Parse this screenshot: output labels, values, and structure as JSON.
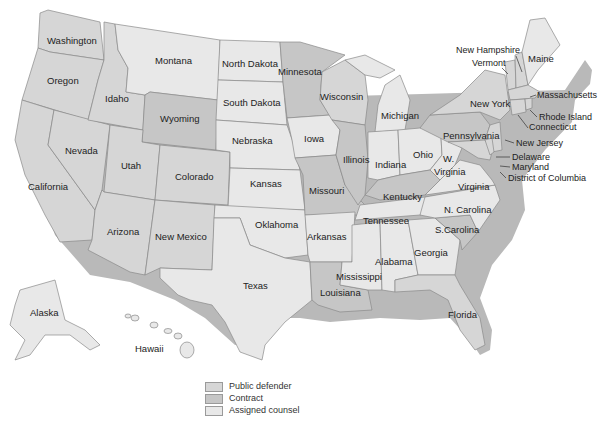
{
  "caption_fragment": "",
  "legend": {
    "items": [
      {
        "label": "Public defender",
        "color": "#d6d6d6"
      },
      {
        "label": "Contract",
        "color": "#c6c6c6"
      },
      {
        "label": "Assigned counsel",
        "color": "#e8e8e8"
      }
    ]
  },
  "labels": {
    "washington": "Washington",
    "oregon": "Oregon",
    "idaho": "Idaho",
    "montana": "Montana",
    "wyoming": "Wyoming",
    "nevada": "Nevada",
    "california": "California",
    "utah": "Utah",
    "colorado": "Colorado",
    "arizona": "Arizona",
    "new_mexico": "New Mexico",
    "north_dakota": "North Dakota",
    "south_dakota": "South Dakota",
    "nebraska": "Nebraska",
    "kansas": "Kansas",
    "oklahoma": "Oklahoma",
    "texas": "Texas",
    "minnesota": "Minnesota",
    "iowa": "Iowa",
    "missouri": "Missouri",
    "arkansas": "Arkansas",
    "louisiana": "Louisiana",
    "wisconsin": "Wisconsin",
    "illinois": "Illinois",
    "michigan": "Michigan",
    "indiana": "Indiana",
    "ohio": "Ohio",
    "kentucky": "Kentucky",
    "tennessee": "Tennessee",
    "mississippi": "Mississippi",
    "alabama": "Alabama",
    "georgia": "Georgia",
    "florida": "Florida",
    "s_carolina": "S.Carolina",
    "n_carolina": "N. Carolina",
    "virginia": "Virginia",
    "w_virginia_1": "W.",
    "w_virginia_2": "Virginia",
    "pennsylvania": "Pennsylvania",
    "new_york": "New York",
    "vermont": "Vermont",
    "new_hampshire": "New Hampshire",
    "maine": "Maine",
    "massachusetts": "Massachusetts",
    "rhode_island": "Rhode Island",
    "connecticut": "Connecticut",
    "new_jersey": "New Jersey",
    "delaware": "Delaware",
    "maryland": "Maryland",
    "dc": "District of Columbia",
    "alaska": "Alaska",
    "hawaii": "Hawaii"
  }
}
